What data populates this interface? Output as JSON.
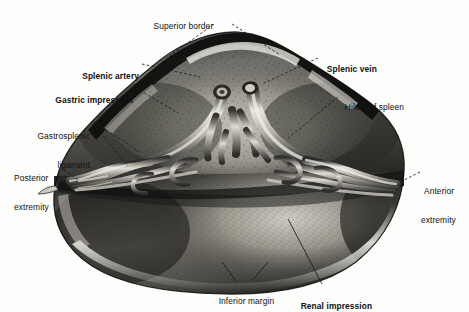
{
  "figure": {
    "background_color": "#fdfdfb",
    "ink_color": "#111111"
  },
  "labels": [
    {
      "id": "superior-border",
      "text": "Superior border",
      "bold": false,
      "align": "center",
      "x": 181,
      "y": 12
    },
    {
      "id": "splenic-artery",
      "text": "Splenic artery",
      "bold": true,
      "align": "right",
      "x": 69,
      "y": 62
    },
    {
      "id": "splenic-vein",
      "text": "Splenic vein",
      "bold": true,
      "align": "left",
      "x": 322,
      "y": 55
    },
    {
      "id": "gastric-impression",
      "text": "Gastric impression",
      "bold": true,
      "align": "right",
      "x": 31,
      "y": 86
    },
    {
      "id": "hilum-of-spleen",
      "text": "Hilum of spleen",
      "bold": false,
      "align": "left",
      "x": 340,
      "y": 93
    },
    {
      "id": "gastrosplenic-ligament-line1",
      "text": "Gastrosplenic",
      "bold": false,
      "align": "right",
      "x": 24,
      "y": 113
    },
    {
      "id": "gastrosplenic-ligament-line2",
      "text": "ligament",
      "bold": false,
      "align": "right",
      "x": 24,
      "y": 123
    },
    {
      "id": "posterior-extremity-line1",
      "text": "Posterior",
      "bold": false,
      "align": "left",
      "x": 14,
      "y": 155
    },
    {
      "id": "posterior-extremity-line2",
      "text": "extremity",
      "bold": false,
      "align": "left",
      "x": 14,
      "y": 165
    },
    {
      "id": "anterior-extremity-line1",
      "text": "Anterior",
      "bold": false,
      "align": "left",
      "x": 424,
      "y": 168
    },
    {
      "id": "anterior-extremity-line2",
      "text": "extremity",
      "bold": false,
      "align": "left",
      "x": 421,
      "y": 178
    },
    {
      "id": "inferior-margin",
      "text": "Inferior margin",
      "bold": false,
      "align": "center",
      "x": 244,
      "y": 287
    },
    {
      "id": "renal-impression",
      "text": "Renal impression",
      "bold": true,
      "align": "center",
      "x": 334,
      "y": 292
    }
  ],
  "structures": [
    {
      "id": "superior-border",
      "kind": "border"
    },
    {
      "id": "gastric-impression",
      "kind": "surface-depression"
    },
    {
      "id": "renal-impression",
      "kind": "surface-depression"
    },
    {
      "id": "hilum-of-spleen",
      "kind": "hilum"
    },
    {
      "id": "splenic-artery",
      "kind": "vessel"
    },
    {
      "id": "splenic-vein",
      "kind": "vessel"
    },
    {
      "id": "gastrosplenic-ligament",
      "kind": "ligament"
    },
    {
      "id": "anterior-extremity",
      "kind": "extremity"
    },
    {
      "id": "posterior-extremity",
      "kind": "extremity"
    },
    {
      "id": "inferior-margin",
      "kind": "margin"
    }
  ]
}
